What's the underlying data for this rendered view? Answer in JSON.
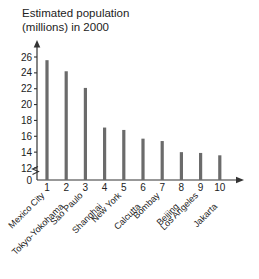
{
  "chart_data": {
    "type": "bar",
    "title": "Estimated population\n(millions) in 2000",
    "xlabel": "",
    "ylabel": "",
    "ylim": [
      12,
      26
    ],
    "y_ticks": [
      12,
      14,
      16,
      18,
      20,
      22,
      24,
      26
    ],
    "y_axis_break": true,
    "y_origin_label": "0",
    "grid": false,
    "legend": null,
    "x_ticks": [
      "1",
      "2",
      "3",
      "4",
      "5",
      "6",
      "7",
      "8",
      "9",
      "10"
    ],
    "categories": [
      "Mexico City",
      "Tokyo-Yokohama",
      "Sao Paulo",
      "Shanghai",
      "New York",
      "Calcutta",
      "Bombay",
      "Beijing",
      "Los Angeles",
      "Jakarta"
    ],
    "values": [
      25.6,
      24.2,
      22.1,
      17.1,
      16.8,
      15.7,
      15.4,
      14.0,
      13.9,
      13.6
    ],
    "bar_color": "#6b6b6b",
    "axis_color": "#333333"
  }
}
